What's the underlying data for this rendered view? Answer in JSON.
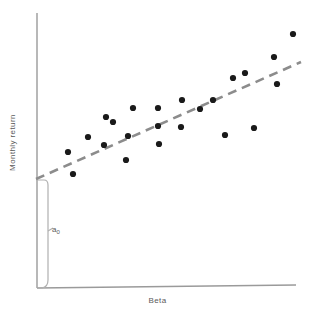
{
  "figure": {
    "xlabel": "Beta",
    "ylabel": "Monthly return",
    "intercept_symbol": "a",
    "intercept_subscript": "0"
  },
  "colors": {
    "point": "#1a1a1a",
    "axis": "#9a9a9a",
    "trendline": "#8c8c8c",
    "text": "#5a5a5a",
    "background": "#ffffff"
  },
  "chart_data": {
    "type": "scatter",
    "title": "",
    "xlabel": "Beta",
    "ylabel": "Monthly return",
    "grid": false,
    "legend": false,
    "axis_ticks": false,
    "xlim": [
      0,
      1
    ],
    "ylim": [
      0,
      1
    ],
    "annotations": [
      {
        "text": "a0",
        "meaning": "intercept of the fitted line at the vertical axis",
        "marker": "brace"
      }
    ],
    "series": [
      {
        "name": "Securities",
        "type": "scatter",
        "marker": "filled-circle",
        "points": [
          [
            73,
            174
          ],
          [
            88,
            137
          ],
          [
            104,
            145
          ],
          [
            113,
            122
          ],
          [
            126,
            160
          ],
          [
            128,
            136
          ],
          [
            133,
            108
          ],
          [
            158,
            108
          ],
          [
            159,
            144
          ],
          [
            158,
            126
          ],
          [
            182,
            100
          ],
          [
            181,
            127
          ],
          [
            200,
            109
          ],
          [
            213,
            100
          ],
          [
            225,
            135
          ],
          [
            233,
            78
          ],
          [
            245,
            73
          ],
          [
            254,
            128
          ],
          [
            274,
            57
          ],
          [
            277,
            84
          ],
          [
            293,
            34
          ],
          [
            68,
            152
          ],
          [
            106,
            117
          ]
        ]
      },
      {
        "name": "Fitted regression line",
        "type": "line",
        "style": "dashed",
        "endpoints": [
          [
            36,
            179
          ],
          [
            301,
            62
          ]
        ]
      }
    ]
  }
}
